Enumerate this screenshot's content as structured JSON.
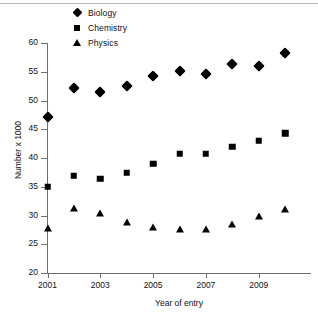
{
  "chart_data": {
    "type": "scatter",
    "title": "",
    "xlabel": "Year of entry",
    "ylabel": "Number x 1000",
    "x": [
      2001,
      2002,
      2003,
      2004,
      2005,
      2006,
      2007,
      2008,
      2009,
      2010
    ],
    "xlim": [
      2001,
      2010
    ],
    "ylim": [
      20,
      60
    ],
    "yticks": [
      20,
      25,
      30,
      35,
      40,
      45,
      50,
      55,
      60
    ],
    "xticks": [
      2001,
      2003,
      2005,
      2007,
      2009
    ],
    "xtick_labels": [
      "2001",
      "2003",
      "2005",
      "2007",
      "2009"
    ],
    "ytick_labels": [
      "20",
      "25",
      "30",
      "35",
      "40",
      "45",
      "50",
      "55",
      "60"
    ],
    "grid": false,
    "legend_position": "top-center",
    "series": [
      {
        "name": "Biology",
        "marker": "diamond",
        "color": "#000000",
        "values": [
          47.2,
          52.1,
          51.4,
          52.5,
          54.2,
          55.2,
          54.6,
          56.4,
          56.0,
          58.3
        ]
      },
      {
        "name": "Chemistry",
        "marker": "square",
        "color": "#000000",
        "values": [
          35.0,
          36.9,
          36.4,
          37.4,
          39.0,
          40.7,
          40.7,
          42.0,
          43.0,
          44.3
        ]
      },
      {
        "name": "Physics",
        "marker": "triangle",
        "color": "#000000",
        "values": [
          27.8,
          31.2,
          30.4,
          28.8,
          27.9,
          27.5,
          27.5,
          28.4,
          29.8,
          31.1
        ]
      }
    ]
  },
  "legend": {
    "items": [
      {
        "label": "Biology",
        "marker": "diamond"
      },
      {
        "label": "Chemistry",
        "marker": "square"
      },
      {
        "label": "Physics",
        "marker": "triangle"
      }
    ]
  },
  "axes": {
    "y_title": "Number x 1000",
    "x_title": "Year of entry"
  }
}
